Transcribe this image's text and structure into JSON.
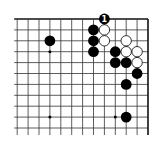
{
  "board": {
    "description": "Partial 19x19 Go board diagram, top-right region shown",
    "visible_columns": 13,
    "visible_rows": 11,
    "origin": {
      "right_edge_x": 148,
      "top_edge_y": 19
    },
    "spacing": 10.9,
    "edges": {
      "top": true,
      "right": true,
      "left": false,
      "bottom": false
    },
    "colors": {
      "black": "#000000",
      "white": "#ffffff",
      "line": "#333333"
    },
    "star_points": [
      {
        "col_from_right": 9,
        "row": 3
      },
      {
        "col_from_right": 3,
        "row": 3
      },
      {
        "col_from_right": 9,
        "row": 9
      },
      {
        "col_from_right": 3,
        "row": 9
      }
    ],
    "stones": [
      {
        "color": "black",
        "col_from_right": 9,
        "row": 2
      },
      {
        "color": "black",
        "col_from_right": 4,
        "row": 0,
        "label": "1"
      },
      {
        "color": "black",
        "col_from_right": 5,
        "row": 1
      },
      {
        "color": "black",
        "col_from_right": 5,
        "row": 2
      },
      {
        "color": "black",
        "col_from_right": 5,
        "row": 3
      },
      {
        "color": "white",
        "col_from_right": 4,
        "row": 1
      },
      {
        "color": "white",
        "col_from_right": 4,
        "row": 2
      },
      {
        "color": "white",
        "col_from_right": 2,
        "row": 2
      },
      {
        "color": "black",
        "col_from_right": 3,
        "row": 3
      },
      {
        "color": "white",
        "col_from_right": 2,
        "row": 3
      },
      {
        "color": "white",
        "col_from_right": 1,
        "row": 3
      },
      {
        "color": "black",
        "col_from_right": 3,
        "row": 4
      },
      {
        "color": "black",
        "col_from_right": 2,
        "row": 4
      },
      {
        "color": "white",
        "col_from_right": 1,
        "row": 4
      },
      {
        "color": "black",
        "col_from_right": 1,
        "row": 5
      },
      {
        "color": "black",
        "col_from_right": 2,
        "row": 6
      },
      {
        "color": "black",
        "col_from_right": 2,
        "row": 9
      }
    ]
  }
}
